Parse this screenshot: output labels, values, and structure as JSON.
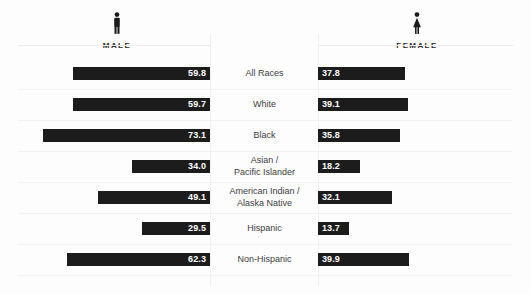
{
  "header": {
    "male": {
      "label": "MALE",
      "icon": "male-figure-icon"
    },
    "female": {
      "label": "FEMALE",
      "icon": "female-figure-icon"
    }
  },
  "colors": {
    "bar": "#1c1c1c",
    "value_text": "#ffffff",
    "category_text": "#3c3c3c",
    "background": "#fdfdfd",
    "separator": "#f3f3f3",
    "axis_line": "#f0f0f0"
  },
  "chart_data": {
    "type": "bar",
    "orientation": "horizontal-diverging",
    "title": "",
    "subtitle": "",
    "xlabel": "",
    "ylabel": "",
    "grid": false,
    "legend_position": "top",
    "series": [
      {
        "name": "MALE",
        "align": "right",
        "values": [
          59.8,
          59.7,
          73.1,
          34.0,
          49.1,
          29.5,
          62.3
        ],
        "labels": [
          "59.8",
          "59.7",
          "73.1",
          "34.0",
          "49.1",
          "29.5",
          "62.3"
        ]
      },
      {
        "name": "FEMALE",
        "align": "left",
        "values": [
          37.8,
          39.1,
          35.8,
          18.2,
          32.1,
          13.7,
          39.9
        ],
        "labels": [
          "37.8",
          "39.1",
          "35.8",
          "18.2",
          "32.1",
          "13.7",
          "39.9"
        ]
      }
    ],
    "categories": [
      {
        "line1": "All Races",
        "line2": ""
      },
      {
        "line1": "White",
        "line2": ""
      },
      {
        "line1": "Black",
        "line2": ""
      },
      {
        "line1": "Asian /",
        "line2": "Pacific Islander"
      },
      {
        "line1": "American Indian /",
        "line2": "Alaska Native"
      },
      {
        "line1": "Hispanic",
        "line2": ""
      },
      {
        "line1": "Non-Hispanic",
        "line2": ""
      }
    ],
    "value_max": 75,
    "xlim": [
      0,
      75
    ]
  }
}
